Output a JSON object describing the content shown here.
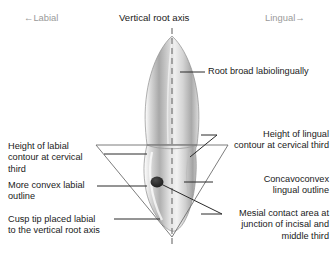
{
  "figure": {
    "title_axis_label": "Vertical root axis",
    "orientation_left": "←Labial",
    "orientation_right": "Lingual→",
    "background_color": "#ffffff",
    "line_color": "#2b2b2b",
    "orientation_text_color": "#9a9a9a",
    "tooth_fill_light": "#f2f2f2",
    "tooth_fill_mid": "#c9c9c9",
    "tooth_fill_dark": "#8f8f8f",
    "contact_area_color": "#1f1f1f"
  },
  "annotations": {
    "root_broad": "Root broad labiolingually",
    "height_labial_contour": "Height of labial\ncontour at cervical\nthird",
    "more_convex_labial": "More convex labial\noutline",
    "cusp_tip": "Cusp tip placed labial\nto the vertical root axis",
    "height_lingual_contour": "Height of lingual\ncontour at cervical third",
    "concavoconvex": "Concavoconvex\nlingual outline",
    "mesial_contact": "Mesial contact area at\njunction of incisal and\nmiddle third"
  }
}
